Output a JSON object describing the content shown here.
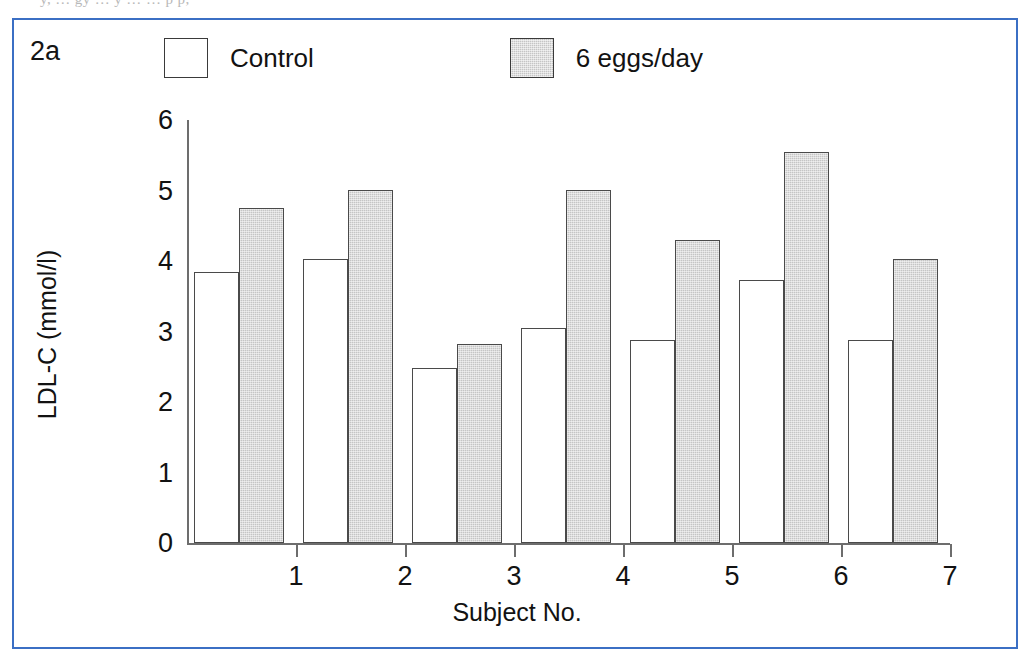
{
  "page": {
    "clipped_text_above_figure": "y,      …  gy  …   y …  … p p,"
  },
  "figure": {
    "panel_label": "2a",
    "border_color": "#3b6fc4",
    "background_color": "#ffffff"
  },
  "legend": {
    "position": "top",
    "entries": [
      {
        "label": "Control",
        "swatch": "white-square-swatch",
        "color": "#ffffff"
      },
      {
        "label": "6 eggs/day",
        "swatch": "gray-square-swatch",
        "color": "#c5c5c5"
      }
    ]
  },
  "chart_data": {
    "type": "bar",
    "title": "",
    "xlabel": "Subject No.",
    "ylabel": "LDL-C (mmol/l)",
    "categories": [
      "1",
      "2",
      "3",
      "4",
      "5",
      "6",
      "7"
    ],
    "series": [
      {
        "name": "Control",
        "values": [
          3.85,
          4.03,
          2.48,
          3.05,
          2.88,
          3.73,
          2.88
        ]
      },
      {
        "name": "6 eggs/day",
        "values": [
          4.75,
          5.01,
          2.82,
          5.01,
          4.3,
          5.55,
          4.03
        ]
      }
    ],
    "ylim": [
      0,
      6
    ],
    "yticks": [
      0,
      1,
      2,
      3,
      4,
      5,
      6
    ],
    "ytick_labels": [
      "0",
      "1",
      "2",
      "3",
      "4",
      "5",
      "6"
    ],
    "xtick_labels": [
      "1",
      "2",
      "3",
      "4",
      "5",
      "6",
      "7"
    ],
    "grid": false,
    "legend_position": "top"
  }
}
